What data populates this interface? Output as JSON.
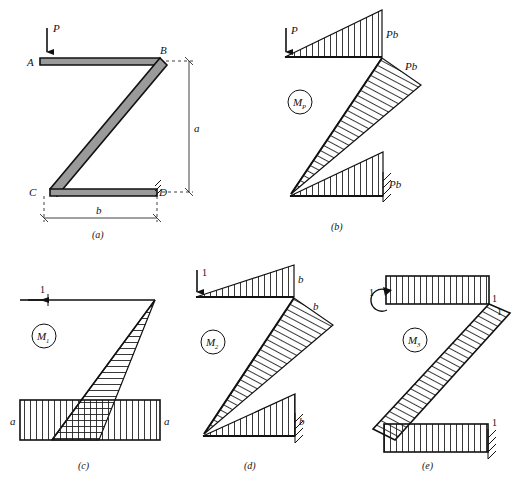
{
  "figure": {
    "background": "#ffffff",
    "stroke": "#111111",
    "frame_fill": "#9a9a9a",
    "hatch_color": "#222222"
  },
  "panels": [
    {
      "id": "a",
      "caption": "(a)",
      "kind": "frame-geometry",
      "joint_labels": [
        "A",
        "B",
        "C",
        "D"
      ],
      "load_label": "P",
      "dimension_labels": {
        "vertical": "a",
        "horizontal": "b"
      },
      "description": "Z shaped frame with vertical load P at A and fixed support at D"
    },
    {
      "id": "b",
      "caption": "(b)",
      "kind": "moment-diagram",
      "diagram_label": "M",
      "diagram_subscript": "P",
      "load_label": "P",
      "load_type": "force-arrow-down",
      "value_labels": [
        "Pb",
        "Pb",
        "Pb"
      ],
      "support": "fixed"
    },
    {
      "id": "c",
      "caption": "(c)",
      "kind": "moment-diagram",
      "diagram_label": "M",
      "diagram_subscript": "1",
      "load_label": "1",
      "load_type": "force-arrow-left",
      "value_labels": [
        "a",
        "a"
      ],
      "support": "none"
    },
    {
      "id": "d",
      "caption": "(d)",
      "kind": "moment-diagram",
      "diagram_label": "M",
      "diagram_subscript": "2",
      "load_label": "1",
      "load_type": "force-arrow-down",
      "value_labels": [
        "b",
        "b",
        "b"
      ],
      "support": "fixed"
    },
    {
      "id": "e",
      "caption": "(e)",
      "kind": "moment-diagram",
      "diagram_label": "M",
      "diagram_subscript": "3",
      "load_label": "1",
      "load_type": "moment-couple",
      "value_labels": [
        "1",
        "1",
        "1"
      ],
      "support": "fixed"
    }
  ]
}
